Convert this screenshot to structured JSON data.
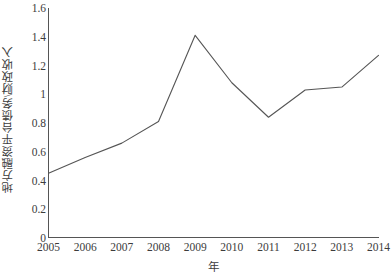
{
  "chart_data": {
    "type": "line",
    "title": "",
    "subtitle": "",
    "xlabel": "年",
    "ylabel": "地方融资平台债务\\财政收入",
    "categories": [
      "2005",
      "2006",
      "2007",
      "2008",
      "2009",
      "2010",
      "2011",
      "2012",
      "2013",
      "2014"
    ],
    "x": [
      2005,
      2006,
      2007,
      2008,
      2009,
      2010,
      2011,
      2012,
      2013,
      2014
    ],
    "values": [
      0.45,
      0.56,
      0.66,
      0.81,
      1.41,
      1.08,
      0.84,
      1.03,
      1.05,
      1.27
    ],
    "series": [
      {
        "name": "地方融资平台债务\\财政收入",
        "values": [
          0.45,
          0.56,
          0.66,
          0.81,
          1.41,
          1.08,
          0.84,
          1.03,
          1.05,
          1.27
        ]
      }
    ],
    "xlim": [
      2005,
      2014
    ],
    "ylim": [
      0,
      1.6
    ],
    "ytick_values": [
      0,
      0.2,
      0.4,
      0.6,
      0.8,
      1,
      1.2,
      1.4,
      1.6
    ],
    "ytick_labels": [
      "0",
      "0.2",
      "0.4",
      "0.6",
      "0.8",
      "1",
      "1.2",
      "1.4",
      "1.6"
    ],
    "xtick_labels": [
      "2005",
      "2006",
      "2007",
      "2008",
      "2009",
      "2010",
      "2011",
      "2012",
      "2013",
      "2014"
    ],
    "grid": false,
    "legend": false,
    "legend_position": "none",
    "line_color": "#555555",
    "axis_color": "#555555",
    "background_color": "#ffffff",
    "markers": false,
    "annotations": []
  }
}
